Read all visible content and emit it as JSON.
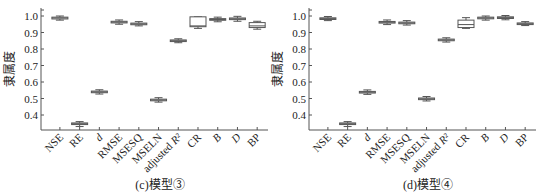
{
  "chart_data": [
    {
      "type": "box",
      "title": "(c)模型③",
      "xlabel": "",
      "ylabel": "隶属度",
      "ylim": [
        0.31,
        1.02
      ],
      "yticks": [
        0.4,
        0.5,
        0.6,
        0.7,
        0.8,
        0.9,
        1.0
      ],
      "ytick_labels": [
        "0.4",
        "0.5",
        "0.6",
        "0.7",
        "0.8",
        "0.9",
        "1.0"
      ],
      "grid": false,
      "categories": [
        "NSE",
        "RE",
        "d",
        "RMSE",
        "MSESQ",
        "MSELN",
        "adjusted R²",
        "CR",
        "B",
        "D",
        "BP"
      ],
      "boxes": [
        {
          "category": "NSE",
          "min": 0.975,
          "q1": 0.982,
          "median": 0.988,
          "q3": 0.993,
          "max": 1.0
        },
        {
          "category": "RE",
          "min": 0.33,
          "q1": 0.342,
          "median": 0.347,
          "q3": 0.352,
          "max": 0.36
        },
        {
          "category": "d",
          "min": 0.527,
          "q1": 0.535,
          "median": 0.54,
          "q3": 0.545,
          "max": 0.553
        },
        {
          "category": "RMSE",
          "min": 0.95,
          "q1": 0.958,
          "median": 0.963,
          "q3": 0.968,
          "max": 0.976
        },
        {
          "category": "MSESQ",
          "min": 0.94,
          "q1": 0.947,
          "median": 0.952,
          "q3": 0.957,
          "max": 0.966
        },
        {
          "category": "MSELN",
          "min": 0.478,
          "q1": 0.486,
          "median": 0.491,
          "q3": 0.496,
          "max": 0.505
        },
        {
          "category": "adjusted R²",
          "min": 0.838,
          "q1": 0.845,
          "median": 0.85,
          "q3": 0.855,
          "max": 0.862
        },
        {
          "category": "CR",
          "min": 0.925,
          "q1": 0.935,
          "median": 0.94,
          "q3": 0.995,
          "max": 0.995
        },
        {
          "category": "B",
          "min": 0.965,
          "q1": 0.974,
          "median": 0.979,
          "q3": 0.984,
          "max": 0.993
        },
        {
          "category": "D",
          "min": 0.968,
          "q1": 0.978,
          "median": 0.983,
          "q3": 0.988,
          "max": 0.998
        },
        {
          "category": "BP",
          "min": 0.92,
          "q1": 0.93,
          "median": 0.94,
          "q3": 0.96,
          "max": 0.968
        }
      ]
    },
    {
      "type": "box",
      "title": "(d)模型④",
      "xlabel": "",
      "ylabel": "隶属度",
      "ylim": [
        0.31,
        1.02
      ],
      "yticks": [
        0.4,
        0.5,
        0.6,
        0.7,
        0.8,
        0.9,
        1.0
      ],
      "ytick_labels": [
        "0.4",
        "0.5",
        "0.6",
        "0.7",
        "0.8",
        "0.9",
        "1.0"
      ],
      "grid": false,
      "categories": [
        "NSE",
        "RE",
        "d",
        "RMSE",
        "MSESQ",
        "MSELN",
        "adjusted R²",
        "CR",
        "B",
        "D",
        "BP"
      ],
      "boxes": [
        {
          "category": "NSE",
          "min": 0.972,
          "q1": 0.979,
          "median": 0.984,
          "q3": 0.989,
          "max": 0.997
        },
        {
          "category": "RE",
          "min": 0.33,
          "q1": 0.342,
          "median": 0.347,
          "q3": 0.352,
          "max": 0.36
        },
        {
          "category": "d",
          "min": 0.525,
          "q1": 0.533,
          "median": 0.538,
          "q3": 0.543,
          "max": 0.552
        },
        {
          "category": "RMSE",
          "min": 0.948,
          "q1": 0.957,
          "median": 0.962,
          "q3": 0.967,
          "max": 0.976
        },
        {
          "category": "MSESQ",
          "min": 0.945,
          "q1": 0.953,
          "median": 0.958,
          "q3": 0.963,
          "max": 0.972
        },
        {
          "category": "MSELN",
          "min": 0.485,
          "q1": 0.493,
          "median": 0.498,
          "q3": 0.503,
          "max": 0.512
        },
        {
          "category": "adjusted R²",
          "min": 0.842,
          "q1": 0.85,
          "median": 0.855,
          "q3": 0.86,
          "max": 0.868
        },
        {
          "category": "CR",
          "min": 0.925,
          "q1": 0.93,
          "median": 0.948,
          "q3": 0.975,
          "max": 0.99
        },
        {
          "category": "B",
          "min": 0.975,
          "q1": 0.983,
          "median": 0.988,
          "q3": 0.993,
          "max": 1.0
        },
        {
          "category": "D",
          "min": 0.977,
          "q1": 0.985,
          "median": 0.99,
          "q3": 0.995,
          "max": 1.003
        },
        {
          "category": "BP",
          "min": 0.942,
          "q1": 0.948,
          "median": 0.953,
          "q3": 0.958,
          "max": 0.966
        }
      ]
    }
  ],
  "colors": {
    "axis": "#555555",
    "box_stroke": "#555555",
    "box_fill": "#ffffff",
    "text": "#222222"
  }
}
